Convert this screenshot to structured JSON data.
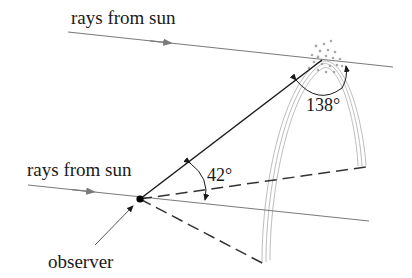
{
  "labels": {
    "rays_top": "rays from sun",
    "rays_bottom": "rays from sun",
    "observer": "observer",
    "angle_observer": "42°",
    "angle_droplet": "138°"
  },
  "colors": {
    "ray": "#7a7a7a",
    "solid": "#1a1a1a",
    "dashed": "#333333",
    "rainbow": "#b8b8b8",
    "droplets": "#a8a8a8"
  }
}
